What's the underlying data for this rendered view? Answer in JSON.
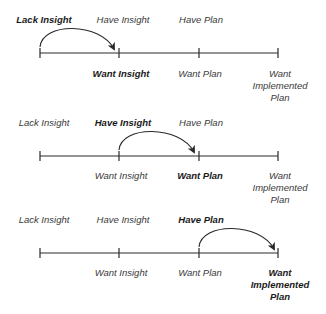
{
  "diagram": {
    "stages_top": [
      "Lack Insight",
      "Have Insight",
      "Have Plan"
    ],
    "stages_bottom": [
      "Want Insight",
      "Want Plan",
      "Want Implemented Plan"
    ],
    "panels": [
      {
        "top": {
          "lack_insight": "Lack Insight",
          "have_insight": "Have Insight",
          "have_plan": "Have Plan"
        },
        "bottom": {
          "want_insight": "Want Insight",
          "want_plan": "Want Plan",
          "want_implemented_plan": [
            "Want",
            "Implemented",
            "Plan"
          ]
        },
        "highlight_from": "Lack Insight",
        "highlight_to": "Want Insight"
      },
      {
        "top": {
          "lack_insight": "Lack Insight",
          "have_insight": "Have Insight",
          "have_plan": "Have Plan"
        },
        "bottom": {
          "want_insight": "Want Insight",
          "want_plan": "Want Plan",
          "want_implemented_plan": [
            "Want",
            "Implemented",
            "Plan"
          ]
        },
        "highlight_from": "Have Insight",
        "highlight_to": "Want Plan"
      },
      {
        "top": {
          "lack_insight": "Lack Insight",
          "have_insight": "Have Insight",
          "have_plan": "Have Plan"
        },
        "bottom": {
          "want_insight": "Want Insight",
          "want_plan": "Want Plan",
          "want_implemented_plan": [
            "Want",
            "Implemented",
            "Plan"
          ]
        },
        "highlight_from": "Have Plan",
        "highlight_to": "Want Implemented Plan"
      }
    ],
    "colors": {
      "line": "#2a2a2a",
      "text": "#3a3a3a",
      "bold_text": "#1a1a1a"
    }
  }
}
